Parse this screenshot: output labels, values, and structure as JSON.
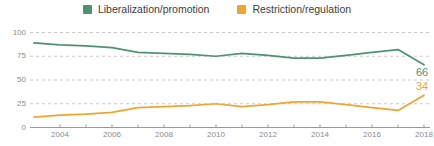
{
  "legend": {
    "items": [
      {
        "label": "Liberalization/promotion",
        "color": "#4f9271",
        "swatch_name": "legend-swatch-liberalization"
      },
      {
        "label": "Restriction/regulation",
        "color": "#f0a52e",
        "swatch_name": "legend-swatch-restriction"
      }
    ]
  },
  "axes": {
    "y_ticks": [
      "0",
      "25",
      "50",
      "75",
      "100"
    ],
    "x_ticks": [
      "2004",
      "2006",
      "2008",
      "2010",
      "2012",
      "2014",
      "2016",
      "2018"
    ]
  },
  "end_labels": {
    "liberalization": "66",
    "restriction": "34"
  },
  "chart_data": {
    "type": "line",
    "title": "",
    "subtitle": "",
    "xlabel": "",
    "ylabel": "",
    "xlim": [
      2003,
      2018
    ],
    "ylim": [
      0,
      100
    ],
    "grid": true,
    "grid_style": "dashed-horizontal",
    "legend_position": "top-center",
    "x": [
      2003,
      2004,
      2005,
      2006,
      2007,
      2008,
      2009,
      2010,
      2011,
      2012,
      2013,
      2014,
      2015,
      2016,
      2017,
      2018
    ],
    "x_tick_values": [
      2004,
      2006,
      2008,
      2010,
      2012,
      2014,
      2016,
      2018
    ],
    "y_tick_values": [
      0,
      25,
      50,
      75,
      100
    ],
    "series": [
      {
        "name": "Liberalization/promotion",
        "color": "#4f9271",
        "end_value_label": "66",
        "values": [
          89,
          87,
          86,
          84,
          79,
          78,
          77,
          75,
          78,
          76,
          73,
          73,
          76,
          79,
          82,
          66
        ]
      },
      {
        "name": "Restriction/regulation",
        "color": "#f0a52e",
        "end_value_label": "34",
        "values": [
          11,
          13,
          14,
          16,
          21,
          22,
          23,
          25,
          22,
          24,
          27,
          27,
          24,
          21,
          18,
          34
        ]
      }
    ],
    "annotations": [
      {
        "text": "66",
        "series": "Liberalization/promotion",
        "x": 2018,
        "y": 66
      },
      {
        "text": "34",
        "series": "Restriction/regulation",
        "x": 2018,
        "y": 34
      }
    ]
  }
}
